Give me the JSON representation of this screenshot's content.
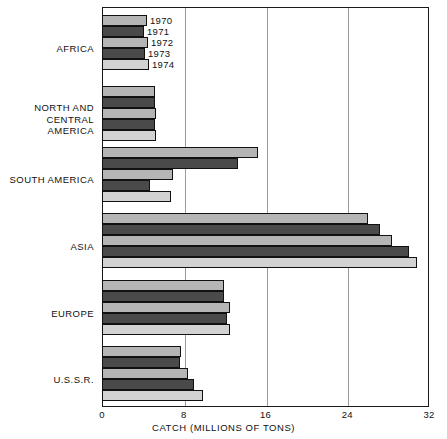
{
  "chart_data": {
    "type": "bar",
    "orientation": "horizontal",
    "title": "",
    "xlabel": "CATCH (MILLIONS OF TONS)",
    "ylabel": "",
    "xlim": [
      0,
      32
    ],
    "xticks": [
      0,
      8,
      16,
      24,
      32
    ],
    "xtick_labels": [
      "0",
      "8",
      "16",
      "24",
      "32"
    ],
    "grid": "vertical",
    "legend_position": "inside-top-left",
    "categories": [
      "AFRICA",
      "NORTH AND\nCENTRAL AMERICA",
      "SOUTH AMERICA",
      "ASIA",
      "EUROPE",
      "U.S.S.R."
    ],
    "series": [
      {
        "name": "1970",
        "values": [
          4.4,
          5.2,
          15.3,
          26.0,
          11.9,
          7.7
        ]
      },
      {
        "name": "1971",
        "values": [
          4.1,
          5.2,
          13.3,
          27.2,
          11.9,
          7.6
        ]
      },
      {
        "name": "1972",
        "values": [
          4.5,
          5.3,
          6.9,
          28.4,
          12.5,
          8.4
        ]
      },
      {
        "name": "1973",
        "values": [
          4.2,
          5.2,
          4.7,
          30.0,
          12.2,
          9.0
        ]
      },
      {
        "name": "1974",
        "values": [
          4.6,
          5.3,
          6.7,
          30.8,
          12.5,
          9.9
        ]
      }
    ],
    "legend": [
      "1970",
      "1971",
      "1972",
      "1973",
      "1974"
    ]
  },
  "axis": {
    "ticks": [
      "0",
      "8",
      "16",
      "24",
      "32"
    ],
    "title": "CATCH (MILLIONS OF TONS)"
  },
  "regions": [
    {
      "label": "AFRICA"
    },
    {
      "label": "NORTH AND\nCENTRAL AMERICA"
    },
    {
      "label": "SOUTH AMERICA"
    },
    {
      "label": "ASIA"
    },
    {
      "label": "EUROPE"
    },
    {
      "label": "U.S.S.R."
    }
  ],
  "legend": [
    {
      "year": "1970"
    },
    {
      "year": "1971"
    },
    {
      "year": "1972"
    },
    {
      "year": "1973"
    },
    {
      "year": "1974"
    }
  ]
}
